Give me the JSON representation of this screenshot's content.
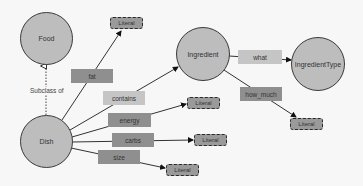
{
  "diagram": {
    "type": "ontology-graph",
    "nodes": {
      "food": "Food",
      "dish": "Dish",
      "ingredient": "Ingredient",
      "ingredient_type": "IngredientType"
    },
    "literal_label": "Literal",
    "annotations": {
      "subclass": "Subclass of"
    },
    "edges": {
      "fat": "fat",
      "contains": "contains",
      "energy": "energy",
      "carbs": "carbs",
      "size": "size",
      "what": "what",
      "how_much": "how_much"
    },
    "relations": [
      {
        "from": "Dish",
        "to": "Food",
        "label": "Subclass of",
        "style": "dotted"
      },
      {
        "from": "Dish",
        "to": "Literal",
        "label": "fat"
      },
      {
        "from": "Dish",
        "to": "Ingredient",
        "label": "contains"
      },
      {
        "from": "Dish",
        "to": "Literal",
        "label": "energy"
      },
      {
        "from": "Dish",
        "to": "Literal",
        "label": "carbs"
      },
      {
        "from": "Dish",
        "to": "Literal",
        "label": "size"
      },
      {
        "from": "Ingredient",
        "to": "IngredientType",
        "label": "what"
      },
      {
        "from": "Ingredient",
        "to": "Literal",
        "label": "how_much"
      }
    ],
    "colors": {
      "node_fill": "#bdbdbd",
      "node_border": "#3a3a3a",
      "label_dark": "#8f8f8f",
      "label_light": "#c5c5c5",
      "literal_fill": "#9a9a9a",
      "background": "#f7f7f7"
    }
  }
}
